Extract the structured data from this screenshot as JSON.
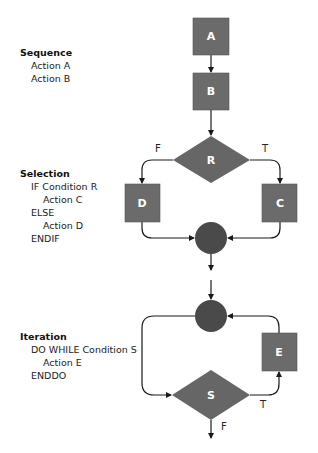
{
  "colors": {
    "box": "#6b6b6b",
    "diamond": "#666666",
    "junction": "#4a4a4a",
    "line": "#1a1a1a",
    "shape_text": "#ffffff"
  },
  "sequence": {
    "title": "Sequence",
    "lines": [
      "Action A",
      "Action B"
    ]
  },
  "selection": {
    "title": "Selection",
    "lines": [
      "IF Condition R",
      "Action C",
      "ELSE",
      "Action D",
      "ENDIF"
    ]
  },
  "iteration": {
    "title": "Iteration",
    "lines": [
      "DO WHILE Condition S",
      "Action E",
      "ENDDO"
    ]
  },
  "nodes": {
    "a": "A",
    "b": "B",
    "r": "R",
    "c": "C",
    "d": "D",
    "e": "E",
    "s": "S"
  },
  "edge_labels": {
    "r_false": "F",
    "r_true": "T",
    "s_true": "T",
    "s_false": "F"
  }
}
